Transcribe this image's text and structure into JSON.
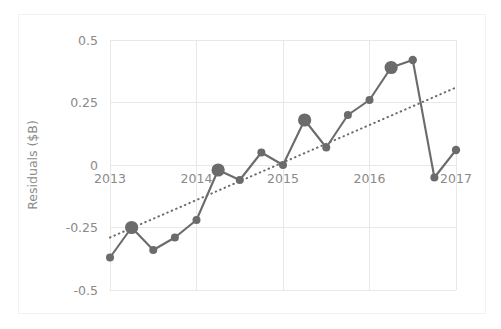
{
  "figure": {
    "title": "",
    "width": 501,
    "height": 329,
    "background": "#ffffff",
    "frame_color": "#f3f3f3"
  },
  "chart_data": {
    "type": "line",
    "title": "",
    "subtitle": "",
    "xlabel": "",
    "ylabel": "Residuals ($B)",
    "xlim": [
      2013,
      2017
    ],
    "ylim": [
      -0.5,
      0.5
    ],
    "xticks": [
      2013,
      2014,
      2015,
      2016,
      2017
    ],
    "xtick_labels": [
      "2013",
      "2014",
      "2015",
      "2016",
      "2017"
    ],
    "yticks": [
      -0.5,
      -0.25,
      0,
      0.25,
      0.5
    ],
    "ytick_labels": [
      "-0.5",
      "-0.25",
      "0",
      "0.25",
      "0.5"
    ],
    "grid": true,
    "grid_color": "#e8e8e8",
    "legend": false,
    "legend_position": "none",
    "series": [
      {
        "name": "Residuals",
        "style": "solid-line-with-markers",
        "color": "#6b6b6b",
        "x": [
          2013.0,
          2013.25,
          2013.5,
          2013.75,
          2014.0,
          2014.25,
          2014.5,
          2014.75,
          2015.0,
          2015.25,
          2015.5,
          2015.75,
          2016.0,
          2016.25,
          2016.5,
          2016.75,
          2017.0
        ],
        "values": [
          -0.37,
          -0.25,
          -0.34,
          -0.29,
          -0.22,
          -0.02,
          -0.06,
          0.05,
          0.0,
          0.18,
          0.07,
          0.2,
          0.26,
          0.39,
          0.42,
          -0.05,
          0.06
        ],
        "marker_sizes": [
          4.0,
          6.6,
          4.0,
          4.0,
          4.0,
          6.6,
          4.0,
          4.0,
          4.0,
          6.6,
          4.0,
          4.0,
          4.0,
          6.6,
          4.2,
          4.0,
          4.2
        ]
      },
      {
        "name": "Trend",
        "style": "dotted-line",
        "color": "#6b6b6b",
        "x": [
          2013.0,
          2017.0
        ],
        "values": [
          -0.29,
          0.31
        ]
      }
    ]
  }
}
